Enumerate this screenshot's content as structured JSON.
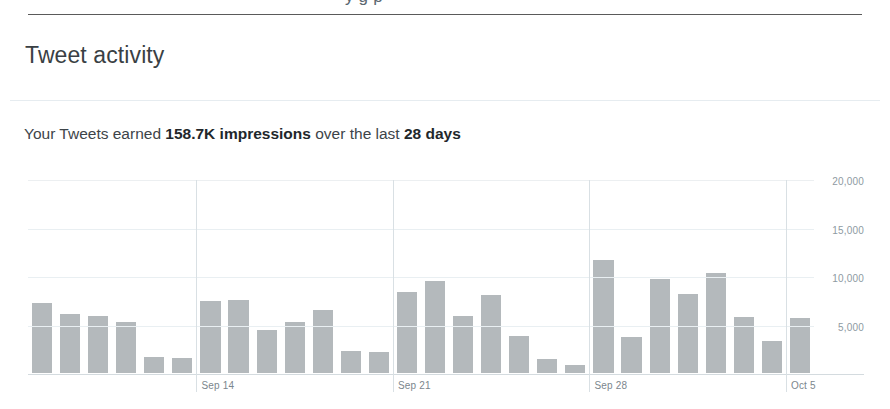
{
  "top_partial_text": "y g p",
  "card": {
    "title": "Tweet activity"
  },
  "summary": {
    "prefix": "Your Tweets earned ",
    "impressions": "158.7K impressions",
    "middle": " over the last ",
    "period": "28 days"
  },
  "chart_data": {
    "type": "bar",
    "title": "Tweet activity",
    "xlabel": "",
    "ylabel": "",
    "ylim": [
      0,
      20000
    ],
    "grid": true,
    "legend": false,
    "bar_color": "#b4b9bc",
    "ytick_labels": [
      "20,000",
      "15,000",
      "10,000",
      "5,000"
    ],
    "yticks": [
      20000,
      15000,
      10000,
      5000
    ],
    "xtick_labels": [
      "Sep 14",
      "Sep 21",
      "Sep 28",
      "Oct 5"
    ],
    "xtick_indices": [
      6,
      13,
      20,
      27
    ],
    "categories": [
      "Sep 8",
      "Sep 9",
      "Sep 10",
      "Sep 11",
      "Sep 12",
      "Sep 13",
      "Sep 14",
      "Sep 15",
      "Sep 16",
      "Sep 17",
      "Sep 18",
      "Sep 19",
      "Sep 20",
      "Sep 21",
      "Sep 22",
      "Sep 23",
      "Sep 24",
      "Sep 25",
      "Sep 26",
      "Sep 27",
      "Sep 28",
      "Sep 29",
      "Sep 30",
      "Oct 1",
      "Oct 2",
      "Oct 3",
      "Oct 4",
      "Oct 5"
    ],
    "values": [
      7200,
      6050,
      5850,
      5300,
      1650,
      1550,
      7400,
      7500,
      4400,
      5300,
      6450,
      2300,
      2200,
      8350,
      9500,
      5850,
      8000,
      3850,
      1450,
      850,
      11600,
      3750,
      9700,
      8150,
      10300,
      5800,
      3350,
      5650
    ]
  }
}
